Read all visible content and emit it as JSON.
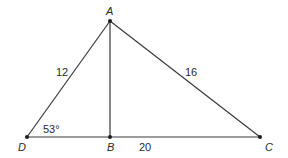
{
  "diagram": {
    "type": "geometry-triangle",
    "points": {
      "A": {
        "label": "A",
        "x": 110,
        "y": 21
      },
      "D": {
        "label": "D",
        "x": 27,
        "y": 137
      },
      "B": {
        "label": "B",
        "x": 110,
        "y": 137
      },
      "C": {
        "label": "C",
        "x": 260,
        "y": 137
      }
    },
    "segments": [
      {
        "from": "A",
        "to": "D"
      },
      {
        "from": "A",
        "to": "B"
      },
      {
        "from": "A",
        "to": "C"
      },
      {
        "from": "D",
        "to": "C"
      }
    ],
    "measurements": {
      "AD": "12",
      "AC": "16",
      "BC": "20",
      "angle_D": "53°"
    },
    "colors": {
      "line": "#3a3a3a",
      "point": "#1e1e1e",
      "text": "#2a2a2a",
      "background": "#ffffff"
    }
  }
}
